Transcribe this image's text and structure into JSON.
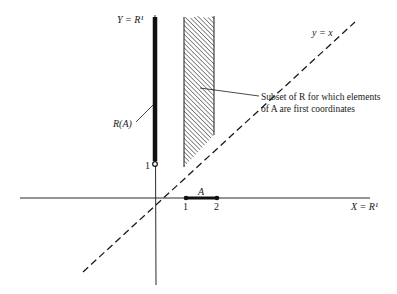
{
  "figure": {
    "y_axis_label": "Y = R¹",
    "x_axis_label": "X = R¹",
    "diagonal_label": "y = x",
    "range_label": "R(A)",
    "set_label": "A",
    "tick_y_1": "1",
    "tick_x_1": "1",
    "tick_x_2": "2",
    "annotation_line1": "Subset of R for which elements",
    "annotation_line2": "of A are first coordinates"
  },
  "colors": {
    "ink": "#1a1a1a",
    "background": "#ffffff"
  }
}
